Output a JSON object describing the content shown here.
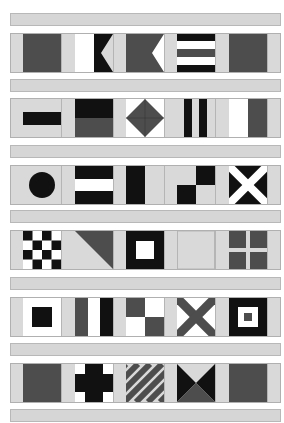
{
  "colors": {
    "dark": "#111111",
    "grey": "#4d4d4d",
    "light": "#d9d9d9",
    "white": "#ffffff",
    "rail": "#d6d6d6"
  },
  "rows": [
    {
      "flags": [
        "solid-grey",
        "white-black-swallowtail",
        "grey-white-swallowtail",
        "black-white-horizontal-stripes",
        "solid-grey"
      ]
    },
    {
      "flags": [
        "black-bar-on-light",
        "black-over-grey",
        "grey-diamond",
        "black-vertical-stripes",
        "white-grey-vertical"
      ]
    },
    {
      "flags": [
        "black-circle",
        "black-white-black-horizontal",
        "black-light-vertical",
        "checker-quarters",
        "white-saltire-on-black"
      ]
    },
    {
      "flags": [
        "checkerboard",
        "grey-diagonal-triangle",
        "white-square-on-black",
        "solid-light",
        "light-cross-on-grey"
      ]
    },
    {
      "flags": [
        "black-square-on-white",
        "grey-white-black-vertical",
        "grey-white-quarters",
        "grey-saltire-on-white",
        "nested-squares"
      ]
    },
    {
      "flags": [
        "solid-grey",
        "black-cross-on-white",
        "diagonal-stripes",
        "black-hourglass",
        "solid-grey"
      ]
    }
  ]
}
